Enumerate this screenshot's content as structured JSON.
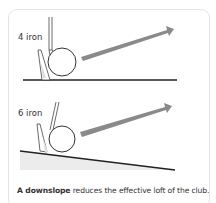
{
  "diagrams": [
    {
      "label": "4 iron",
      "ground": "flat"
    },
    {
      "label": "6 iron",
      "ground": "downslope"
    }
  ],
  "caption": {
    "bold": "A downslope",
    "rest": " reduces the effective loft of the club."
  },
  "colors": {
    "arrow": "#8a8a8a",
    "slope_fill": "#ececec",
    "border": "#e4e4e4"
  }
}
